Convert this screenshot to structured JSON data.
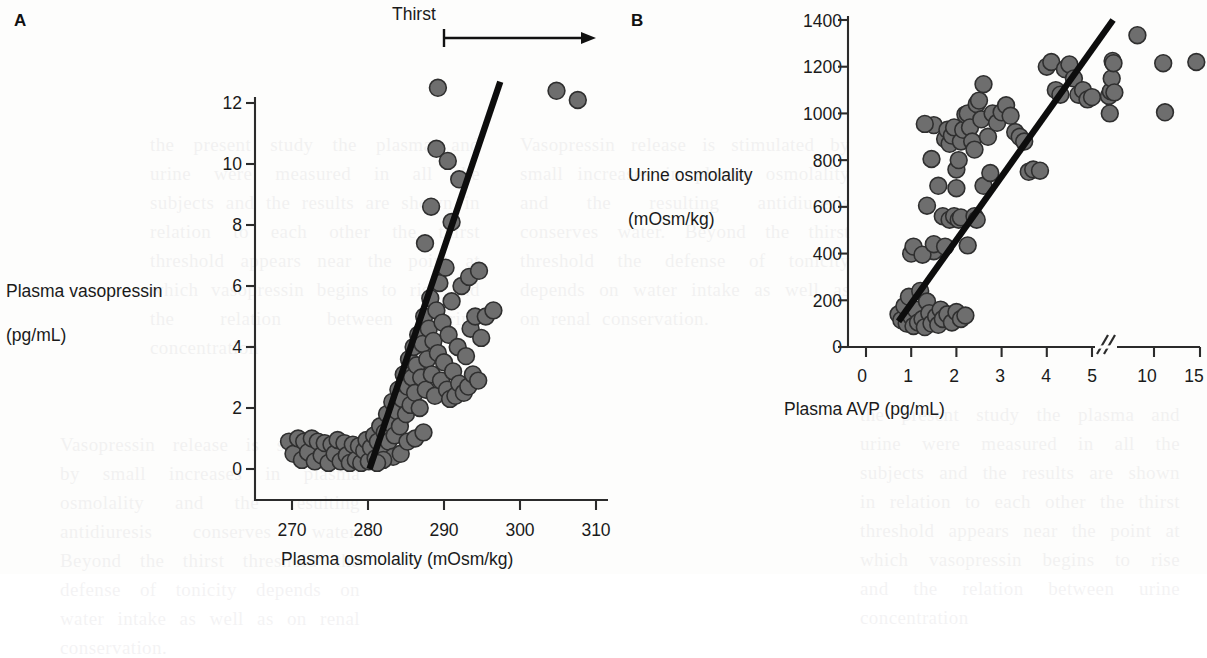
{
  "figure": {
    "background_color": "#fdfdfc",
    "marker_color": "#6e6e6e",
    "marker_edge_color": "#2f2f2f",
    "line_color": "#0d0d0d"
  },
  "panel_a": {
    "letter": "A",
    "annotation": {
      "label": "Thirst",
      "arrow": "rightward arrow with left end-bar"
    },
    "ylabel_line1": "Plasma vasopressin",
    "ylabel_line2": "(pg/mL)",
    "xlabel": "Plasma osmolality (mOsm/kg)",
    "xticks": [
      "270",
      "280",
      "290",
      "300",
      "310"
    ],
    "yticks": [
      "0",
      "2",
      "4",
      "6",
      "8",
      "10",
      "12"
    ]
  },
  "panel_b": {
    "letter": "B",
    "ylabel_line1": "Urine osmolality",
    "ylabel_line2": "(mOsm/kg)",
    "xlabel": "Plasma AVP (pg/mL)",
    "xticks": [
      "0",
      "1",
      "2",
      "3",
      "4",
      "5",
      "10",
      "15"
    ],
    "yticks": [
      "0",
      "200",
      "400",
      "600",
      "800",
      "1000",
      "1200",
      "1400"
    ],
    "axis_break_between": "5 and 10"
  },
  "bleed_text": {
    "col1": "the present study the plasma and urine were measured in all the subjects and the results are shown in relation to each other the thirst threshold appears near the point at which vasopressin begins to rise and the relation between urine concentration",
    "col2": "Vasopressin release is stimulated by small increases in plasma osmolality and the resulting antidiuresis conserves water. Beyond the thirst threshold the defense of tonicity depends on water intake as well as on renal conservation."
  },
  "chart_data": [
    {
      "type": "scatter",
      "panel": "A",
      "title": "",
      "xlabel": "Plasma osmolality (mOsm/kg)",
      "ylabel": "Plasma vasopressin (pg/mL)",
      "xlim": [
        266,
        312
      ],
      "ylim": [
        -0.6,
        13.2
      ],
      "xticks": [
        270,
        280,
        290,
        300,
        310
      ],
      "yticks": [
        0,
        2,
        4,
        6,
        8,
        10,
        12
      ],
      "grid": false,
      "legend": null,
      "annotations": [
        {
          "text": "Thirst",
          "x_start": 290,
          "x_end": 311,
          "kind": "arrow-right",
          "y_pixel_top": true
        }
      ],
      "fit_line": {
        "kind": "linear-segment",
        "x": [
          280.2,
          297.4
        ],
        "y": [
          0.0,
          12.7
        ]
      },
      "points": [
        [
          269.6,
          0.9
        ],
        [
          270.2,
          0.5
        ],
        [
          270.8,
          1.0
        ],
        [
          271.3,
          0.3
        ],
        [
          271.6,
          0.9
        ],
        [
          272.1,
          0.55
        ],
        [
          272.6,
          1.0
        ],
        [
          273.0,
          0.25
        ],
        [
          273.4,
          0.9
        ],
        [
          273.9,
          0.45
        ],
        [
          274.3,
          0.85
        ],
        [
          274.8,
          0.2
        ],
        [
          275.2,
          0.8
        ],
        [
          275.6,
          0.5
        ],
        [
          276.0,
          0.95
        ],
        [
          276.4,
          0.25
        ],
        [
          276.9,
          0.85
        ],
        [
          277.2,
          0.45
        ],
        [
          277.6,
          0.2
        ],
        [
          278.0,
          0.8
        ],
        [
          278.4,
          0.3
        ],
        [
          278.8,
          0.75
        ],
        [
          279.1,
          0.2
        ],
        [
          279.5,
          0.6
        ],
        [
          279.8,
          0.95
        ],
        [
          280.1,
          0.25
        ],
        [
          280.4,
          0.7
        ],
        [
          280.8,
          1.1
        ],
        [
          281.0,
          0.35
        ],
        [
          281.3,
          0.9
        ],
        [
          281.6,
          1.4
        ],
        [
          281.9,
          0.6
        ],
        [
          282.2,
          1.2
        ],
        [
          282.5,
          1.8
        ],
        [
          282.7,
          0.9
        ],
        [
          283.0,
          1.5
        ],
        [
          283.2,
          2.2
        ],
        [
          283.5,
          1.1
        ],
        [
          283.8,
          1.9
        ],
        [
          284.0,
          2.6
        ],
        [
          284.2,
          1.4
        ],
        [
          284.5,
          2.3
        ],
        [
          284.7,
          3.1
        ],
        [
          285.0,
          1.8
        ],
        [
          285.2,
          2.7
        ],
        [
          285.4,
          3.6
        ],
        [
          285.6,
          2.1
        ],
        [
          285.8,
          3.0
        ],
        [
          286.0,
          4.0
        ],
        [
          286.2,
          2.5
        ],
        [
          286.4,
          3.4
        ],
        [
          286.6,
          4.4
        ],
        [
          286.8,
          2.0
        ],
        [
          287.0,
          3.0
        ],
        [
          287.2,
          4.1
        ],
        [
          287.4,
          5.0
        ],
        [
          287.6,
          2.6
        ],
        [
          287.8,
          3.6
        ],
        [
          288.0,
          4.6
        ],
        [
          288.2,
          5.6
        ],
        [
          288.4,
          3.1
        ],
        [
          288.6,
          4.2
        ],
        [
          288.8,
          2.4
        ],
        [
          289.0,
          5.2
        ],
        [
          289.2,
          3.8
        ],
        [
          289.4,
          6.1
        ],
        [
          289.6,
          2.9
        ],
        [
          289.8,
          4.8
        ],
        [
          290.0,
          3.5
        ],
        [
          290.2,
          6.6
        ],
        [
          290.4,
          2.6
        ],
        [
          290.6,
          4.4
        ],
        [
          290.8,
          2.3
        ],
        [
          291.0,
          5.5
        ],
        [
          291.2,
          3.2
        ],
        [
          291.5,
          2.4
        ],
        [
          291.8,
          4.0
        ],
        [
          292.0,
          2.8
        ],
        [
          292.3,
          6.0
        ],
        [
          292.6,
          2.5
        ],
        [
          292.9,
          3.7
        ],
        [
          293.2,
          2.7
        ],
        [
          293.5,
          4.6
        ],
        [
          293.8,
          3.1
        ],
        [
          294.1,
          5.0
        ],
        [
          294.5,
          2.9
        ],
        [
          294.9,
          4.3
        ],
        [
          287.5,
          7.4
        ],
        [
          288.3,
          8.6
        ],
        [
          289.0,
          10.5
        ],
        [
          289.2,
          12.5
        ],
        [
          290.5,
          10.1
        ],
        [
          291.0,
          8.1
        ],
        [
          292.0,
          9.5
        ],
        [
          293.3,
          6.3
        ],
        [
          294.6,
          6.5
        ],
        [
          295.5,
          5.0
        ],
        [
          296.5,
          5.2
        ],
        [
          304.8,
          12.4
        ],
        [
          307.6,
          12.1
        ],
        [
          283.3,
          0.4
        ],
        [
          284.3,
          0.5
        ],
        [
          285.2,
          0.9
        ],
        [
          286.2,
          1.0
        ],
        [
          287.3,
          1.2
        ],
        [
          282.0,
          0.3
        ],
        [
          281.2,
          0.2
        ]
      ]
    },
    {
      "type": "scatter",
      "panel": "B",
      "title": "",
      "xlabel": "Plasma AVP (pg/mL)",
      "ylabel": "Urine osmolality (mOsm/kg)",
      "x_axis_note": "broken axis: linear 0-5, then compressed 5-10-15",
      "xlim": [
        0,
        15
      ],
      "ylim": [
        0,
        1450
      ],
      "xticks": [
        0,
        1,
        2,
        3,
        4,
        5,
        10,
        15
      ],
      "yticks": [
        0,
        200,
        400,
        600,
        800,
        1000,
        1200,
        1400
      ],
      "grid": false,
      "legend": null,
      "fit_line": {
        "kind": "linear-segment",
        "x": [
          0.72,
          5.55
        ],
        "y": [
          110,
          1400
        ]
      },
      "points": [
        [
          0.72,
          140
        ],
        [
          0.78,
          115
        ],
        [
          0.85,
          175
        ],
        [
          0.9,
          100
        ],
        [
          0.95,
          215
        ],
        [
          1.0,
          130
        ],
        [
          1.05,
          90
        ],
        [
          1.1,
          160
        ],
        [
          1.15,
          105
        ],
        [
          1.2,
          240
        ],
        [
          1.25,
          120
        ],
        [
          1.3,
          85
        ],
        [
          1.35,
          195
        ],
        [
          1.4,
          145
        ],
        [
          1.45,
          100
        ],
        [
          1.5,
          410
        ],
        [
          1.55,
          130
        ],
        [
          1.6,
          95
        ],
        [
          1.65,
          160
        ],
        [
          1.7,
          120
        ],
        [
          1.8,
          140
        ],
        [
          1.9,
          105
        ],
        [
          2.0,
          150
        ],
        [
          2.1,
          120
        ],
        [
          2.2,
          135
        ],
        [
          1.0,
          400
        ],
        [
          1.05,
          430
        ],
        [
          1.25,
          395
        ],
        [
          1.5,
          440
        ],
        [
          1.75,
          430
        ],
        [
          1.35,
          605
        ],
        [
          1.6,
          690
        ],
        [
          1.7,
          560
        ],
        [
          1.85,
          545
        ],
        [
          1.95,
          560
        ],
        [
          2.0,
          680
        ],
        [
          2.05,
          545
        ],
        [
          2.1,
          555
        ],
        [
          1.45,
          805
        ],
        [
          1.5,
          950
        ],
        [
          1.3,
          955
        ],
        [
          1.75,
          890
        ],
        [
          1.8,
          930
        ],
        [
          1.85,
          870
        ],
        [
          1.9,
          905
        ],
        [
          1.95,
          940
        ],
        [
          2.0,
          760
        ],
        [
          2.05,
          800
        ],
        [
          2.1,
          880
        ],
        [
          2.15,
          930
        ],
        [
          2.2,
          995
        ],
        [
          2.25,
          1000
        ],
        [
          2.3,
          940
        ],
        [
          2.35,
          880
        ],
        [
          2.4,
          845
        ],
        [
          2.45,
          1040
        ],
        [
          2.5,
          1055
        ],
        [
          2.55,
          975
        ],
        [
          2.6,
          1125
        ],
        [
          2.7,
          900
        ],
        [
          2.8,
          1000
        ],
        [
          2.9,
          960
        ],
        [
          3.0,
          1005
        ],
        [
          3.1,
          1035
        ],
        [
          3.2,
          990
        ],
        [
          3.3,
          920
        ],
        [
          3.4,
          900
        ],
        [
          3.5,
          880
        ],
        [
          3.6,
          750
        ],
        [
          3.7,
          760
        ],
        [
          3.85,
          755
        ],
        [
          4.0,
          1200
        ],
        [
          4.1,
          1220
        ],
        [
          4.2,
          1100
        ],
        [
          4.3,
          1080
        ],
        [
          4.4,
          1190
        ],
        [
          4.5,
          1210
        ],
        [
          4.6,
          1150
        ],
        [
          4.7,
          1080
        ],
        [
          4.8,
          1100
        ],
        [
          4.9,
          1060
        ],
        [
          5.0,
          1070
        ],
        [
          5.1,
          1075
        ],
        [
          5.2,
          1000
        ],
        [
          5.3,
          1095
        ],
        [
          5.4,
          1150
        ],
        [
          5.5,
          1225
        ],
        [
          5.6,
          1215
        ],
        [
          5.7,
          1090
        ],
        [
          8.2,
          1335
        ],
        [
          11.0,
          1215
        ],
        [
          11.2,
          1005
        ],
        [
          14.6,
          1220
        ],
        [
          2.25,
          435
        ],
        [
          2.4,
          560
        ],
        [
          2.45,
          545
        ],
        [
          2.6,
          690
        ],
        [
          2.75,
          745
        ]
      ]
    }
  ]
}
